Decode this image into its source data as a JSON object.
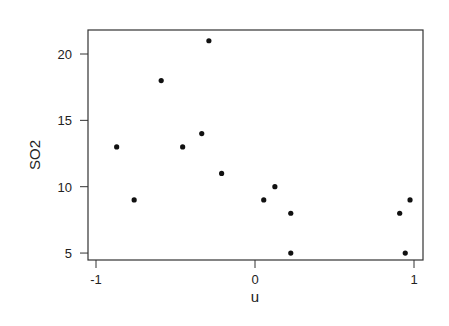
{
  "chart_data": {
    "type": "scatter",
    "title": "",
    "xlabel": "u",
    "ylabel": "SO2",
    "xlim": [
      -1.03,
      1.06
    ],
    "ylim": [
      4.6,
      21.8
    ],
    "xticks": [
      -1,
      0,
      1
    ],
    "xtick_labels": [
      "-1",
      "0",
      "1"
    ],
    "yticks": [
      5,
      10,
      15,
      20
    ],
    "ytick_labels": [
      "5",
      "10",
      "15",
      "20"
    ],
    "grid": false,
    "legend": null,
    "points": [
      {
        "x": -0.87,
        "y": 13
      },
      {
        "x": -0.76,
        "y": 9
      },
      {
        "x": -0.59,
        "y": 18
      },
      {
        "x": -0.455,
        "y": 13
      },
      {
        "x": -0.335,
        "y": 14
      },
      {
        "x": -0.29,
        "y": 21
      },
      {
        "x": -0.21,
        "y": 11
      },
      {
        "x": 0.055,
        "y": 9
      },
      {
        "x": 0.125,
        "y": 10
      },
      {
        "x": 0.225,
        "y": 8
      },
      {
        "x": 0.225,
        "y": 5
      },
      {
        "x": 0.91,
        "y": 8
      },
      {
        "x": 0.975,
        "y": 9
      },
      {
        "x": 0.945,
        "y": 5
      }
    ],
    "marker_color": "#111111",
    "axis_color": "#333333"
  }
}
